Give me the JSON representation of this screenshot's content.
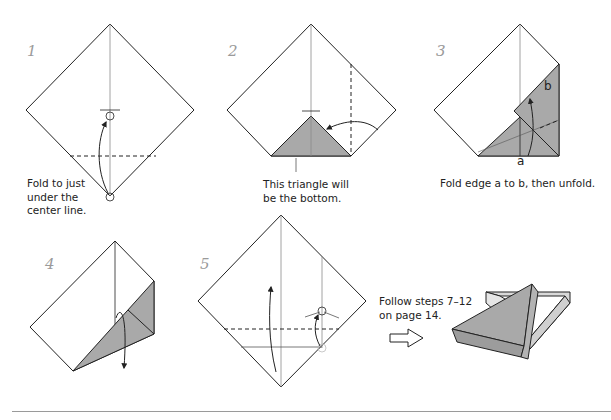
{
  "page": {
    "colors": {
      "paper_fill": "#ffffff",
      "shade_fill": "#a9a9a9",
      "shade_light": "#d9d9d9",
      "line": "#222222",
      "guide": "#8a8a8a",
      "step_number": "#9a9a9a"
    }
  },
  "steps": [
    {
      "number": "1",
      "caption_lines": [
        "Fold to just",
        "under the",
        "center line."
      ]
    },
    {
      "number": "2",
      "caption_lines": [
        "This triangle will",
        "be the bottom."
      ]
    },
    {
      "number": "3",
      "caption": "Fold edge a to b, then unfold.",
      "labels": {
        "a": "a",
        "b": "b"
      }
    },
    {
      "number": "4"
    },
    {
      "number": "5"
    }
  ],
  "final": {
    "caption_lines": [
      "Follow steps 7–12",
      "on page 14."
    ],
    "arrow_icon": "hollow-right-arrow"
  }
}
